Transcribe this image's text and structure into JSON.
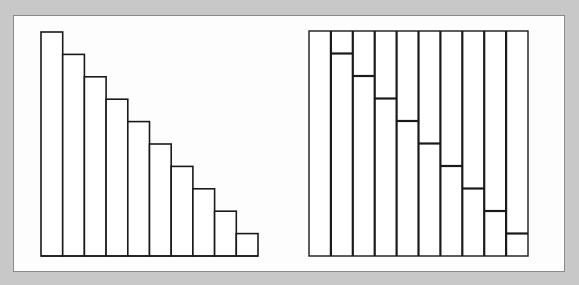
{
  "chart_data": [
    {
      "type": "bar",
      "title": "",
      "xlabel": "",
      "ylabel": "",
      "categories": [
        "1",
        "2",
        "3",
        "4",
        "5",
        "6",
        "7",
        "8",
        "9",
        "10"
      ],
      "values": [
        10,
        9,
        8,
        7,
        6,
        5,
        4,
        3,
        2,
        1
      ],
      "ylim": [
        0,
        10
      ],
      "grid": false,
      "legend": "none",
      "style": "outlined white bars, decreasing staircase"
    },
    {
      "type": "bar",
      "title": "",
      "xlabel": "",
      "ylabel": "",
      "categories": [
        "1",
        "2",
        "3",
        "4",
        "5",
        "6",
        "7",
        "8",
        "9",
        "10"
      ],
      "values": [
        10,
        9,
        8,
        7,
        6,
        5,
        4,
        3,
        2,
        1
      ],
      "remainder": [
        0,
        1,
        2,
        3,
        4,
        5,
        6,
        7,
        8,
        9
      ],
      "ylim": [
        0,
        10
      ],
      "grid": false,
      "legend": "none",
      "style": "full-height columns with horizontal divider at each value (stacked remainder)"
    }
  ],
  "colors": {
    "background": "#c8c8c8",
    "panel": "#fdfdfd",
    "panel_border": "#8a8a8a",
    "stroke": "#1a1a1a"
  },
  "geometry": {
    "left": {
      "x0": 41,
      "width": 217,
      "baseline": 256,
      "top": 32
    },
    "right": {
      "x0": 309,
      "width": 219,
      "baseline": 256,
      "top": 31
    }
  }
}
